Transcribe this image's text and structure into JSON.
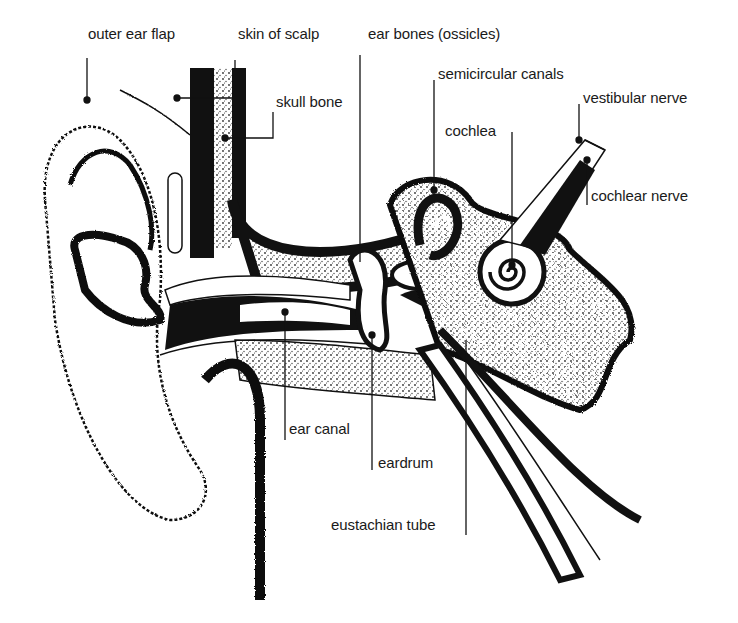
{
  "diagram": {
    "colors": {
      "ink": "#111111",
      "stipple": "#555555",
      "paper": "#ffffff"
    },
    "labels": [
      {
        "id": "outer-ear-flap",
        "text": "outer ear flap",
        "x": 88,
        "y": 33
      },
      {
        "id": "skin-of-scalp",
        "text": "skin of scalp",
        "x": 238,
        "y": 33
      },
      {
        "id": "ear-bones",
        "text": "ear bones (ossicles)",
        "x": 368,
        "y": 33
      },
      {
        "id": "skull-bone",
        "text": "skull bone",
        "x": 276,
        "y": 101
      },
      {
        "id": "semicircular-canals",
        "text": "semicircular canals",
        "x": 438,
        "y": 73
      },
      {
        "id": "vestibular-nerve",
        "text": "vestibular nerve",
        "x": 583,
        "y": 97
      },
      {
        "id": "cochlea",
        "text": "cochlea",
        "x": 445,
        "y": 122
      },
      {
        "id": "cochlear-nerve",
        "text": "cochlear nerve",
        "x": 591,
        "y": 187
      },
      {
        "id": "ear-canal",
        "text": "ear canal",
        "x": 287,
        "y": 423
      },
      {
        "id": "eardrum",
        "text": "eardrum",
        "x": 378,
        "y": 455
      },
      {
        "id": "eustachian-tube",
        "text": "eustachian tube",
        "x": 331,
        "y": 517
      }
    ]
  }
}
